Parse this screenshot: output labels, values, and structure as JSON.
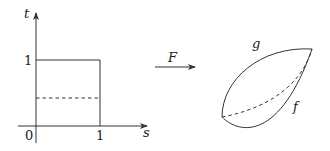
{
  "domain_plot": {
    "axes": {
      "vertical_label": "t",
      "horizontal_label": "s"
    },
    "ticks": {
      "origin": "0",
      "t_one": "1",
      "s_one": "1"
    },
    "region": "unit square [0,1] x [0,1]",
    "dashed_line_description": "horizontal dashed line at t ≈ 0.43"
  },
  "mapping": {
    "label": "F"
  },
  "image_surface": {
    "curve_top_label": "g",
    "curve_bottom_label": "f",
    "dashed_curve_description": "intermediate dashed curve between f and g"
  },
  "colors": {
    "ink": "#333333",
    "background": "#ffffff"
  }
}
